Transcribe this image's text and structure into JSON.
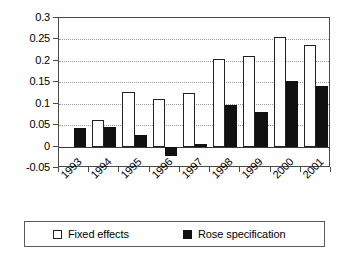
{
  "chart_data": {
    "type": "bar",
    "title": "",
    "subtitle": "",
    "xlabel": "",
    "ylabel": "",
    "categories": [
      "1993",
      "1994",
      "1995",
      "1996",
      "1997",
      "1998",
      "1999",
      "2000",
      "2001"
    ],
    "series": [
      {
        "name": "Fixed effects",
        "style": "white-filled-bar-black-outline",
        "values": [
          null,
          0.063,
          0.127,
          0.111,
          0.124,
          0.204,
          0.212,
          0.255,
          0.238
        ]
      },
      {
        "name": "Rose specification",
        "style": "black-filled-bar",
        "values": [
          0.044,
          0.046,
          0.027,
          -0.022,
          0.005,
          0.098,
          0.08,
          0.154,
          0.142
        ]
      }
    ],
    "ylim": [
      -0.05,
      0.3
    ],
    "yticks": [
      -0.05,
      0,
      0.05,
      0.1,
      0.15,
      0.2,
      0.25,
      0.3
    ],
    "ytick_labels": [
      "-0.05",
      "0",
      "0.05",
      "0.1",
      "0.15",
      "0.2",
      "0.25",
      "0.3"
    ],
    "grid": "horizontal-dotted",
    "legend_position": "bottom",
    "xtick_label_rotation": -45,
    "colors": {
      "fixed_effects": "#ffffff",
      "rose_specification": "#111111",
      "axis": "#4a4a4a",
      "gridline": "#9a9a9a",
      "background": "#ffffff"
    }
  },
  "legend": {
    "entries": [
      {
        "label": "Fixed effects",
        "swatch": "open-square-swatch"
      },
      {
        "label": "Rose specification",
        "swatch": "filled-square-swatch"
      }
    ]
  }
}
